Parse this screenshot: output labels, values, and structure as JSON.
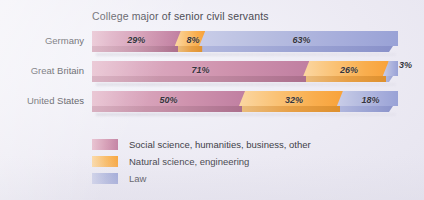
{
  "chart_data": {
    "type": "bar",
    "title": "College major of senior civil servants",
    "xlabel": "",
    "ylabel": "",
    "orientation": "horizontal",
    "stacked": true,
    "stack_total": 100,
    "unit": "%",
    "xlim": [
      0,
      100
    ],
    "grid": false,
    "legend_position": "bottom-left",
    "categories": [
      "Germany",
      "Great Britain",
      "United States"
    ],
    "series": [
      {
        "name": "Social science, humanities, business, other",
        "color": "#c98fab",
        "values": [
          29,
          71,
          50
        ],
        "labels": [
          "29%",
          "71%",
          "50%"
        ]
      },
      {
        "name": "Natural science, engineering",
        "color": "#f9b056",
        "values": [
          8,
          26,
          32
        ],
        "labels": [
          "8%",
          "26%",
          "32%"
        ]
      },
      {
        "name": "Law",
        "color": "#a9b0dc",
        "values": [
          63,
          3,
          18
        ],
        "labels": [
          "63%",
          "3%",
          "18%"
        ]
      }
    ]
  },
  "chart": {
    "title": "College major of senior civil servants",
    "rows": [
      {
        "label": "Germany",
        "segments": [
          {
            "label": "29%",
            "value": 29,
            "series": "social",
            "label_outside": false
          },
          {
            "label": "8%",
            "value": 8,
            "series": "natural",
            "label_outside": false
          },
          {
            "label": "63%",
            "value": 63,
            "series": "law",
            "label_outside": false
          }
        ]
      },
      {
        "label": "Great Britain",
        "segments": [
          {
            "label": "71%",
            "value": 71,
            "series": "social",
            "label_outside": false
          },
          {
            "label": "26%",
            "value": 26,
            "series": "natural",
            "label_outside": false
          },
          {
            "label": "3%",
            "value": 3,
            "series": "law",
            "label_outside": true
          }
        ]
      },
      {
        "label": "United States",
        "segments": [
          {
            "label": "50%",
            "value": 50,
            "series": "social",
            "label_outside": false
          },
          {
            "label": "32%",
            "value": 32,
            "series": "natural",
            "label_outside": false
          },
          {
            "label": "18%",
            "value": 18,
            "series": "law",
            "label_outside": false
          }
        ]
      }
    ],
    "legend": [
      {
        "key": "social",
        "label": "Social science, humanities, business, other",
        "color": "#c98fab"
      },
      {
        "key": "natural",
        "label": "Natural science, engineering",
        "color": "#f9b056"
      },
      {
        "key": "law",
        "label": "Law",
        "color": "#a9b0dc"
      }
    ]
  },
  "colors": {
    "background": "#ececf4",
    "text": "#3f3f48",
    "label_text": "#35353d",
    "social": "#c98fab",
    "natural": "#f9b056",
    "law": "#a9b0dc"
  }
}
